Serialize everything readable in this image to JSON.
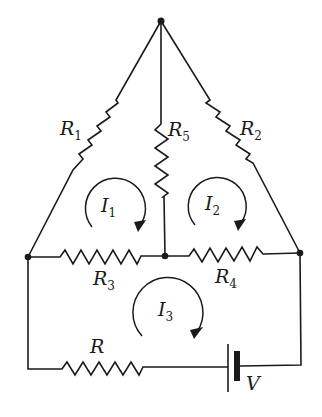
{
  "diagram": {
    "type": "circuit",
    "nodes": [
      {
        "id": "top",
        "x": 161,
        "y": 21
      },
      {
        "id": "left",
        "x": 28,
        "y": 257
      },
      {
        "id": "middle",
        "x": 165,
        "y": 256
      },
      {
        "id": "right",
        "x": 300,
        "y": 253
      }
    ],
    "resistors": [
      {
        "id": "R1",
        "label": "R",
        "sub": "1",
        "between": [
          "top",
          "left"
        ]
      },
      {
        "id": "R2",
        "label": "R",
        "sub": "2",
        "between": [
          "top",
          "right"
        ]
      },
      {
        "id": "R5",
        "label": "R",
        "sub": "5",
        "between": [
          "top",
          "middle"
        ]
      },
      {
        "id": "R3",
        "label": "R",
        "sub": "3",
        "between": [
          "left",
          "middle"
        ]
      },
      {
        "id": "R4",
        "label": "R",
        "sub": "4",
        "between": [
          "middle",
          "right"
        ]
      },
      {
        "id": "R",
        "label": "R",
        "sub": "",
        "between": [
          "left",
          "battery"
        ]
      }
    ],
    "battery": {
      "label": "V",
      "between": [
        "R",
        "right"
      ]
    },
    "loops": [
      {
        "id": "I1",
        "label": "I",
        "sub": "1",
        "direction": "clockwise"
      },
      {
        "id": "I2",
        "label": "I",
        "sub": "2",
        "direction": "clockwise"
      },
      {
        "id": "I3",
        "label": "I",
        "sub": "3",
        "direction": "clockwise"
      }
    ]
  }
}
